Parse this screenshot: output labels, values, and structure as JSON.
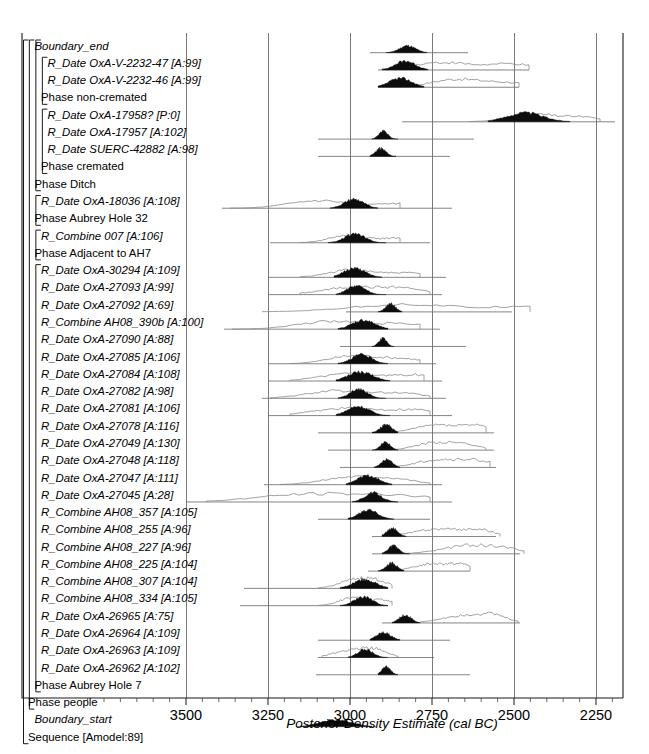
{
  "figure": {
    "kind": "oxcal-posterior-density-plot",
    "axis_title": "Posterior Density Estimate (cal BC)",
    "model_label": "Sequence [Amodel:89]"
  },
  "axis": {
    "tick_labels": [
      "3500",
      "3250",
      "3000",
      "2750",
      "2500",
      "2250"
    ],
    "tick_values": [
      3500,
      3250,
      3000,
      2750,
      2500,
      2250
    ],
    "tick_x_px": [
      186,
      268,
      350,
      432,
      514,
      596
    ],
    "minor_tick_interval": 50,
    "direction": "BC-decreasing-left-to-right"
  },
  "colors": {
    "posterior_fill": "#0d0d0d",
    "prior_outline": "#8a8a8a",
    "range_bar": "#6f6f6f",
    "gridline": "#7a7a7a",
    "frame": "#1a1a1a",
    "background": "#ffffff"
  },
  "chart_data": {
    "type": "area",
    "title": "",
    "xlabel": "Posterior Density Estimate (cal BC)",
    "ylabel": "",
    "xlim": [
      3700,
      2160
    ],
    "grid": true,
    "legend": "none",
    "categories": [
      "Boundary_end",
      "R_Date OxA-V-2232-47 [A:99]",
      "R_Date OxA-V-2232-46 [A:99]",
      "Phase non-cremated",
      "R_Date OxA-17958? [P:0]",
      "R_Date OxA-17957 [A:102]",
      "R_Date SUERC-42882 [A:98]",
      "Phase cremated",
      "Phase Ditch",
      "R_Date OxA-18036 [A:108]",
      "Phase Aubrey Hole 32",
      "R_Combine 007 [A:106]",
      "Phase Adjacent to AH7",
      "R_Date OxA-30294 [A:109]",
      "R_Date OxA-27093 [A:99]",
      "R_Date OxA-27092 [A:69]",
      "R_Combine AH08_390b [A:100]",
      "R_Date OxA-27090 [A:88]",
      "R_Date OxA-27085 [A:106]",
      "R_Date OxA-27084 [A:108]",
      "R_Date OxA-27082 [A:98]",
      "R_Date OxA-27081 [A:106]",
      "R_Date OxA-27078 [A:116]",
      "R_Date OxA-27049 [A:130]",
      "R_Date OxA-27048 [A:118]",
      "R_Date OxA-27047 [A:111]",
      "R_Date OxA-27045 [A:28]",
      "R_Combine AH08_357 [A:105]",
      "R_Combine AH08_255 [A:96]",
      "R_Combine AH08_227 [A:96]",
      "R_Combine AH08_225 [A:104]",
      "R_Combine AH08_307 [A:104]",
      "R_Combine AH08_334 [A:105]",
      "R_Date OxA-26965 [A:75]",
      "R_Date OxA-26964 [A:109]",
      "R_Date OxA-26963 [A:109]",
      "R_Date OxA-26962 [A:102]",
      "Phase Aubrey Hole 7",
      "Phase people",
      "Boundary_start",
      "Sequence [Amodel:89]"
    ],
    "series": [
      {
        "name": "Boundary_end",
        "kind": "boundary",
        "indent": 1,
        "has_distribution": true,
        "posterior_peak": 2890,
        "posterior_range_px": [
          386,
          427
        ],
        "range_bar_px": [
          370,
          468
        ],
        "prior_px": null
      },
      {
        "name": "R_Date OxA-V-2232-47 [A:99]",
        "kind": "date",
        "indent": 3,
        "has_distribution": true,
        "posterior_peak": 2880,
        "posterior_range_px": [
          382,
          428
        ],
        "range_bar_px": [
          378,
          529
        ],
        "prior_px": [
          382,
          529
        ]
      },
      {
        "name": "R_Date OxA-V-2232-46 [A:99]",
        "kind": "date",
        "indent": 3,
        "has_distribution": true,
        "posterior_peak": 2880,
        "posterior_range_px": [
          378,
          424
        ],
        "range_bar_px": [
          378,
          519
        ],
        "prior_px": [
          382,
          519
        ]
      },
      {
        "name": "Phase non-cremated",
        "kind": "phase",
        "indent": 2,
        "has_distribution": false
      },
      {
        "name": "R_Date OxA-17958? [P:0]",
        "kind": "date-outlier",
        "indent": 3,
        "has_distribution": true,
        "posterior_peak": 2540,
        "posterior_range_px": [
          488,
          570
        ],
        "range_bar_px": [
          402,
          615
        ],
        "prior_px": [
          470,
          600
        ]
      },
      {
        "name": "R_Date OxA-17957 [A:102]",
        "kind": "date",
        "indent": 3,
        "has_distribution": true,
        "posterior_peak": 2900,
        "posterior_range_px": [
          372,
          398
        ],
        "range_bar_px": [
          318,
          474
        ],
        "prior_px": null
      },
      {
        "name": "R_Date SUERC-42882 [A:98]",
        "kind": "date",
        "indent": 3,
        "has_distribution": true,
        "posterior_peak": 2900,
        "posterior_range_px": [
          370,
          396
        ],
        "range_bar_px": [
          318,
          450
        ],
        "prior_px": null
      },
      {
        "name": "Phase cremated",
        "kind": "phase",
        "indent": 2,
        "has_distribution": false
      },
      {
        "name": "Phase Ditch",
        "kind": "phase",
        "indent": 1,
        "has_distribution": false
      },
      {
        "name": "R_Date OxA-18036 [A:108]",
        "kind": "date",
        "indent": 2,
        "has_distribution": true,
        "posterior_peak": 2980,
        "posterior_range_px": [
          330,
          378
        ],
        "range_bar_px": [
          222,
          452
        ],
        "prior_px": [
          230,
          400
        ]
      },
      {
        "name": "Phase Aubrey Hole 32",
        "kind": "phase",
        "indent": 1,
        "has_distribution": false
      },
      {
        "name": "R_Combine 007 [A:106]",
        "kind": "combine",
        "indent": 2,
        "has_distribution": true,
        "posterior_peak": 2980,
        "posterior_range_px": [
          328,
          386
        ],
        "range_bar_px": [
          270,
          430
        ],
        "prior_px": [
          300,
          400
        ]
      },
      {
        "name": "Phase Adjacent to AH7",
        "kind": "phase",
        "indent": 1,
        "has_distribution": false
      },
      {
        "name": "R_Date OxA-30294 [A:109]",
        "kind": "date",
        "indent": 2,
        "has_distribution": true,
        "posterior_peak": 3000,
        "posterior_range_px": [
          334,
          382
        ],
        "range_bar_px": [
          268,
          446
        ],
        "prior_px": [
          300,
          420
        ]
      },
      {
        "name": "R_Date OxA-27093 [A:99]",
        "kind": "date",
        "indent": 2,
        "has_distribution": true,
        "posterior_peak": 2980,
        "posterior_range_px": [
          336,
          386
        ],
        "range_bar_px": [
          268,
          442
        ],
        "prior_px": [
          300,
          430
        ]
      },
      {
        "name": "R_Date OxA-27092 [A:69]",
        "kind": "date",
        "indent": 2,
        "has_distribution": true,
        "posterior_peak": 2930,
        "posterior_range_px": [
          378,
          402
        ],
        "range_bar_px": [
          346,
          512
        ],
        "prior_px": [
          262,
          530
        ]
      },
      {
        "name": "R_Combine AH08_390b [A:100]",
        "kind": "combine",
        "indent": 2,
        "has_distribution": true,
        "posterior_peak": 2970,
        "posterior_range_px": [
          338,
          388
        ],
        "range_bar_px": [
          224,
          440
        ],
        "prior_px": [
          232,
          420
        ]
      },
      {
        "name": "R_Date OxA-27090 [A:88]",
        "kind": "date",
        "indent": 2,
        "has_distribution": true,
        "posterior_peak": 2940,
        "posterior_range_px": [
          372,
          394
        ],
        "range_bar_px": [
          340,
          466
        ],
        "prior_px": null
      },
      {
        "name": "R_Date OxA-27085 [A:106]",
        "kind": "date",
        "indent": 2,
        "has_distribution": true,
        "posterior_peak": 2970,
        "posterior_range_px": [
          338,
          388
        ],
        "range_bar_px": [
          268,
          436
        ],
        "prior_px": [
          290,
          420
        ]
      },
      {
        "name": "R_Date OxA-27084 [A:108]",
        "kind": "date",
        "indent": 2,
        "has_distribution": true,
        "posterior_peak": 2970,
        "posterior_range_px": [
          336,
          390
        ],
        "range_bar_px": [
          268,
          442
        ],
        "prior_px": [
          290,
          424
        ]
      },
      {
        "name": "R_Date OxA-27082 [A:98]",
        "kind": "date",
        "indent": 2,
        "has_distribution": true,
        "posterior_peak": 2965,
        "posterior_range_px": [
          338,
          386
        ],
        "range_bar_px": [
          262,
          446
        ],
        "prior_px": [
          270,
          430
        ]
      },
      {
        "name": "R_Date OxA-27081 [A:106]",
        "kind": "date",
        "indent": 2,
        "has_distribution": true,
        "posterior_peak": 2965,
        "posterior_range_px": [
          336,
          390
        ],
        "range_bar_px": [
          268,
          452
        ],
        "prior_px": [
          290,
          430
        ]
      },
      {
        "name": "R_Date OxA-27078 [A:116]",
        "kind": "date",
        "indent": 2,
        "has_distribution": true,
        "posterior_peak": 2930,
        "posterior_range_px": [
          372,
          398
        ],
        "range_bar_px": [
          318,
          494
        ],
        "prior_px": [
          380,
          486
        ]
      },
      {
        "name": "R_Date OxA-27049 [A:130]",
        "kind": "date",
        "indent": 2,
        "has_distribution": true,
        "posterior_peak": 2930,
        "posterior_range_px": [
          372,
          398
        ],
        "range_bar_px": [
          328,
          494
        ],
        "prior_px": [
          380,
          486
        ]
      },
      {
        "name": "R_Date OxA-27048 [A:118]",
        "kind": "date",
        "indent": 2,
        "has_distribution": true,
        "posterior_peak": 2930,
        "posterior_range_px": [
          374,
          400
        ],
        "range_bar_px": [
          340,
          496
        ],
        "prior_px": [
          388,
          490
        ]
      },
      {
        "name": "R_Date OxA-27047 [A:111]",
        "kind": "date",
        "indent": 2,
        "has_distribution": true,
        "posterior_peak": 2960,
        "posterior_range_px": [
          346,
          392
        ],
        "range_bar_px": [
          264,
          442
        ],
        "prior_px": [
          280,
          430
        ]
      },
      {
        "name": "R_Date OxA-27045 [A:28]",
        "kind": "date-poor",
        "indent": 2,
        "has_distribution": true,
        "posterior_peak": 2900,
        "posterior_range_px": [
          352,
          398
        ],
        "range_bar_px": [
          186,
          452
        ],
        "prior_px": [
          206,
          430
        ]
      },
      {
        "name": "R_Combine AH08_357 [A:105]",
        "kind": "combine",
        "indent": 2,
        "has_distribution": true,
        "posterior_peak": 2900,
        "posterior_range_px": [
          348,
          394
        ],
        "range_bar_px": [
          318,
          430
        ]
      },
      {
        "name": "R_Combine AH08_255 [A:96]",
        "kind": "combine",
        "indent": 2,
        "has_distribution": true,
        "posterior_peak": 2870,
        "posterior_range_px": [
          382,
          406
        ],
        "range_bar_px": [
          372,
          496
        ],
        "prior_px": [
          396,
          500
        ]
      },
      {
        "name": "R_Combine AH08_227 [A:96]",
        "kind": "combine",
        "indent": 2,
        "has_distribution": true,
        "posterior_peak": 2870,
        "posterior_range_px": [
          382,
          410
        ],
        "range_bar_px": [
          372,
          520
        ],
        "prior_px": [
          400,
          524
        ]
      },
      {
        "name": "R_Combine AH08_225 [A:104]",
        "kind": "combine",
        "indent": 2,
        "has_distribution": true,
        "posterior_peak": 2880,
        "posterior_range_px": [
          378,
          404
        ],
        "range_bar_px": [
          368,
          470
        ],
        "prior_px": [
          396,
          470
        ]
      },
      {
        "name": "R_Combine AH08_307 [A:104]",
        "kind": "combine",
        "indent": 2,
        "has_distribution": true,
        "posterior_peak": 2950,
        "posterior_range_px": [
          340,
          388
        ],
        "range_bar_px": [
          244,
          388
        ],
        "prior_px": [
          318,
          392
        ]
      },
      {
        "name": "R_Combine AH08_334 [A:105]",
        "kind": "combine",
        "indent": 2,
        "has_distribution": true,
        "posterior_peak": 2950,
        "posterior_range_px": [
          340,
          388
        ],
        "range_bar_px": [
          240,
          388
        ],
        "prior_px": [
          318,
          392
        ]
      },
      {
        "name": "R_Date OxA-26965 [A:75]",
        "kind": "date",
        "indent": 2,
        "has_distribution": true,
        "posterior_peak": 2900,
        "posterior_range_px": [
          392,
          420
        ],
        "range_bar_px": [
          382,
          520
        ],
        "prior_px": [
          420,
          518
        ]
      },
      {
        "name": "R_Date OxA-26964 [A:109]",
        "kind": "date",
        "indent": 2,
        "has_distribution": true,
        "posterior_peak": 2910,
        "posterior_range_px": [
          370,
          400
        ],
        "range_bar_px": [
          318,
          450
        ]
      },
      {
        "name": "R_Date OxA-26963 [A:109]",
        "kind": "date",
        "indent": 2,
        "has_distribution": true,
        "posterior_peak": 2940,
        "posterior_range_px": [
          348,
          388
        ],
        "range_bar_px": [
          318,
          434
        ],
        "prior_px": [
          322,
          398
        ]
      },
      {
        "name": "R_Date OxA-26962 [A:102]",
        "kind": "date",
        "indent": 2,
        "has_distribution": true,
        "posterior_peak": 2900,
        "posterior_range_px": [
          378,
          398
        ],
        "range_bar_px": [
          316,
          470
        ]
      },
      {
        "name": "Phase Aubrey Hole 7",
        "kind": "phase",
        "indent": 1,
        "has_distribution": false
      },
      {
        "name": "Phase people",
        "kind": "phase",
        "indent": 0,
        "has_distribution": false
      },
      {
        "name": "Boundary_start",
        "kind": "boundary",
        "indent": 1,
        "has_distribution": true,
        "posterior_peak": 2990,
        "posterior_range_px": [
          300,
          372
        ],
        "range_bar_px": [
          296,
          376
        ]
      },
      {
        "name": "Sequence [Amodel:89]",
        "kind": "sequence",
        "indent": 0,
        "has_distribution": false
      }
    ]
  }
}
